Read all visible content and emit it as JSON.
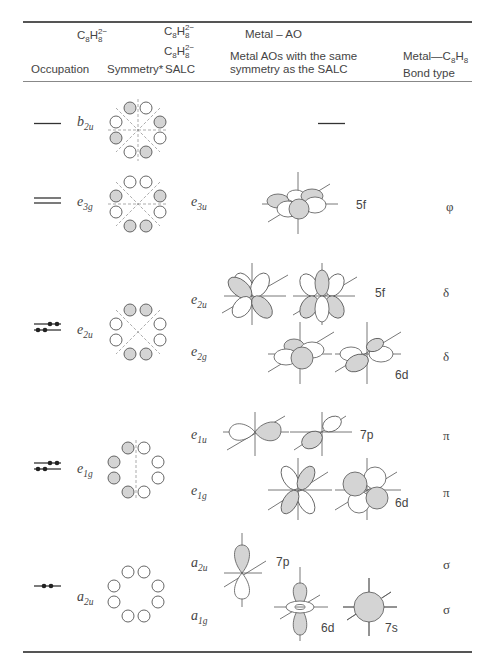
{
  "table": {
    "header": {
      "group_c8h8_left": {
        "base": "C",
        "sub1": "8",
        "mid": "H",
        "sup": "2−",
        "sub2": "8"
      },
      "group_c8h8_mid_top": {
        "base": "C",
        "sub1": "8",
        "mid": "H",
        "sup": "2−",
        "sub2": "8"
      },
      "group_c8h8_mid_bot": {
        "base": "C",
        "sub1": "8",
        "mid": "H",
        "sup": "2−",
        "sub2": "8"
      },
      "metal_ao": "Metal – AO",
      "col_occupation": "Occupation",
      "col_symmetry": "Symmetry*",
      "col_salc": "SALC",
      "col_metal_aos_line1": "Metal AOs with the same",
      "col_metal_aos_line2": "symmetry as the SALC",
      "col_bond_line1_prefix": "Metal—C",
      "col_bond_line1_sub1": "8",
      "col_bond_line1_mid": "H",
      "col_bond_line1_sub2": "8",
      "col_bond_line2": "Bond type"
    },
    "rows": [
      {
        "occupation": "empty single level",
        "symmetry": {
          "b": "b",
          "s": "2u"
        },
        "salc": [],
        "metal_aos": "—",
        "bond": []
      },
      {
        "occupation": "empty degenerate pair",
        "symmetry": {
          "b": "e",
          "s": "3g"
        },
        "salc": [
          {
            "b": "e",
            "s": "3u",
            "ao": "5f",
            "bond": "φ"
          }
        ]
      },
      {
        "occupation": "filled degenerate pair (4 e−)",
        "symmetry": {
          "b": "e",
          "s": "2u"
        },
        "salc": [
          {
            "b": "e",
            "s": "2u",
            "ao": "5f",
            "bond": "δ"
          },
          {
            "b": "e",
            "s": "2g",
            "ao": "6d",
            "bond": "δ"
          }
        ]
      },
      {
        "occupation": "filled degenerate pair (4 e−)",
        "symmetry": {
          "b": "e",
          "s": "1g"
        },
        "salc": [
          {
            "b": "e",
            "s": "1u",
            "ao": "7p",
            "bond": "π"
          },
          {
            "b": "e",
            "s": "1g",
            "ao": "6d",
            "bond": "π"
          }
        ]
      },
      {
        "occupation": "filled single level (2 e−)",
        "symmetry": {
          "b": "a",
          "s": "2u"
        },
        "salc": [
          {
            "b": "a",
            "s": "2u",
            "ao": "7p",
            "bond": "σ"
          },
          {
            "b": "a",
            "s": "1g",
            "ao": "6d",
            "ao2": "7s",
            "bond": "σ"
          }
        ]
      }
    ]
  },
  "colors": {
    "rule": "#555555",
    "shade": "#d4d4d4",
    "stroke": "#555555",
    "text": "#444444"
  }
}
